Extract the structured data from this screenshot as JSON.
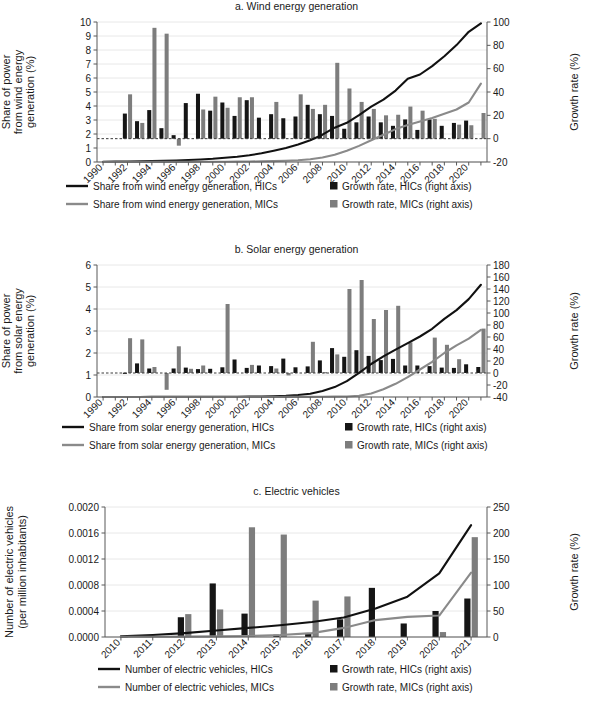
{
  "figure": {
    "cut_off_header": "renewable energy and electric vehicles",
    "panels": [
      "a",
      "b",
      "c"
    ]
  },
  "chart_data": [
    {
      "id": "a",
      "type": "bar",
      "title": "a. Wind energy generation",
      "xlabel": "",
      "ylabel": "Share of power\nfrom wind energy\ngeneration (%)",
      "ylabel_lines": [
        "Share of power",
        "from wind energy",
        "generation (%)"
      ],
      "y2label": "Growth rate (%)",
      "ylim": [
        0,
        10
      ],
      "yticks": [
        0,
        1,
        2,
        3,
        4,
        5,
        6,
        7,
        8,
        9,
        10
      ],
      "y2lim": [
        -20,
        100
      ],
      "y2ticks": [
        -20,
        0,
        20,
        40,
        60,
        80,
        100
      ],
      "grid": true,
      "x": [
        1990,
        1991,
        1992,
        1993,
        1994,
        1995,
        1996,
        1997,
        1998,
        1999,
        2000,
        2001,
        2002,
        2003,
        2004,
        2005,
        2006,
        2007,
        2008,
        2009,
        2010,
        2011,
        2012,
        2013,
        2014,
        2015,
        2016,
        2017,
        2018,
        2019,
        2020,
        2021
      ],
      "xtick_labels": [
        "1990",
        "1992",
        "1994",
        "1996",
        "1998",
        "2000",
        "2002",
        "2004",
        "2006",
        "2008",
        "2010",
        "2012",
        "2014",
        "2016",
        "2018",
        "2020"
      ],
      "series": [
        {
          "name": "Share from wind energy generation, HICs",
          "kind": "line",
          "color": "#111111",
          "axis": "left",
          "values": [
            0.02,
            0.03,
            0.04,
            0.05,
            0.07,
            0.09,
            0.11,
            0.14,
            0.18,
            0.23,
            0.3,
            0.38,
            0.48,
            0.62,
            0.8,
            1.0,
            1.25,
            1.55,
            1.95,
            2.45,
            2.8,
            3.35,
            3.95,
            4.45,
            5.1,
            5.95,
            6.25,
            6.85,
            7.55,
            8.35,
            9.3,
            9.9
          ]
        },
        {
          "name": "Share from wind energy generation, MICs",
          "kind": "line",
          "color": "#8a8a8a",
          "axis": "left",
          "values": [
            0.005,
            0.005,
            0.006,
            0.007,
            0.008,
            0.009,
            0.01,
            0.012,
            0.014,
            0.017,
            0.021,
            0.027,
            0.035,
            0.048,
            0.065,
            0.09,
            0.13,
            0.2,
            0.32,
            0.52,
            0.8,
            1.15,
            1.55,
            1.95,
            2.35,
            2.65,
            2.9,
            3.15,
            3.45,
            3.75,
            4.25,
            5.6
          ]
        },
        {
          "name": "Growth rate, HICs (right axis)",
          "kind": "bar",
          "color": "#151515",
          "axis": "right",
          "values": [
            null,
            null,
            21.5,
            15.0,
            24.5,
            9.0,
            3.0,
            30.5,
            38.5,
            24.0,
            31.0,
            19.5,
            33.0,
            18.0,
            21.0,
            17.5,
            19.0,
            29.0,
            21.0,
            19.5,
            8.5,
            14.0,
            19.0,
            14.0,
            11.0,
            16.5,
            7.5,
            16.5,
            11.0,
            13.5,
            15.5,
            null
          ]
        },
        {
          "name": "Growth rate, MICs (right axis)",
          "kind": "bar",
          "color": "#7d7d7d",
          "axis": "right",
          "values": [
            null,
            null,
            38.0,
            13.5,
            95.0,
            90.0,
            -6.0,
            null,
            25.0,
            36.0,
            26.5,
            35.5,
            35.5,
            null,
            31.5,
            null,
            38.0,
            25.5,
            29.0,
            65.0,
            43.0,
            31.5,
            25.5,
            20.0,
            20.5,
            27.5,
            24.0,
            17.0,
            null,
            12.0,
            11.5,
            22.0
          ]
        }
      ],
      "legend": [
        {
          "marker": "line",
          "color": "#111111",
          "label": "Share from wind energy generation, HICs"
        },
        {
          "marker": "square",
          "color": "#151515",
          "label": "Growth rate, HICs (right axis)"
        },
        {
          "marker": "line",
          "color": "#8a8a8a",
          "label": "Share from wind energy generation, MICs"
        },
        {
          "marker": "square",
          "color": "#7d7d7d",
          "label": "Growth rate, MICs (right axis)"
        }
      ]
    },
    {
      "id": "b",
      "type": "bar",
      "title": "b. Solar energy generation",
      "xlabel": "",
      "ylabel_lines": [
        "Share of power",
        "from solar energy",
        "generation (%)"
      ],
      "y2label": "Growth rate (%)",
      "ylim": [
        0,
        6
      ],
      "yticks": [
        0,
        1,
        2,
        3,
        4,
        5,
        6
      ],
      "y2lim": [
        -40,
        180
      ],
      "y2ticks": [
        -40,
        -20,
        0,
        20,
        40,
        60,
        80,
        100,
        120,
        140,
        160,
        180
      ],
      "grid": true,
      "x": [
        1990,
        1991,
        1992,
        1993,
        1994,
        1995,
        1996,
        1997,
        1998,
        1999,
        2000,
        2001,
        2002,
        2003,
        2004,
        2005,
        2006,
        2007,
        2008,
        2009,
        2010,
        2011,
        2012,
        2013,
        2014,
        2015,
        2016,
        2017,
        2018,
        2019,
        2020,
        2021
      ],
      "xtick_labels": [
        "1990",
        "1992",
        "1994",
        "1996",
        "1998",
        "2000",
        "2002",
        "2004",
        "2006",
        "2008",
        "2010",
        "2012",
        "2014",
        "2016",
        "2018",
        "2020"
      ],
      "series": [
        {
          "name": "Share from solar energy generation, HICs",
          "kind": "line",
          "color": "#111111",
          "axis": "left",
          "values": [
            0.002,
            0.002,
            0.003,
            0.003,
            0.004,
            0.004,
            0.005,
            0.006,
            0.007,
            0.009,
            0.011,
            0.014,
            0.018,
            0.024,
            0.035,
            0.055,
            0.09,
            0.15,
            0.27,
            0.45,
            0.72,
            1.1,
            1.5,
            1.85,
            2.15,
            2.45,
            2.75,
            3.1,
            3.55,
            3.95,
            4.45,
            5.1
          ]
        },
        {
          "name": "Share from solar energy generation, MICs",
          "kind": "line",
          "color": "#8a8a8a",
          "axis": "left",
          "values": [
            0.0,
            0.0,
            0.0,
            0.0,
            0.0,
            0.0,
            0.0,
            0.0,
            0.001,
            0.001,
            0.001,
            0.001,
            0.002,
            0.002,
            0.003,
            0.004,
            0.005,
            0.007,
            0.01,
            0.015,
            0.025,
            0.06,
            0.16,
            0.35,
            0.6,
            0.9,
            1.25,
            1.6,
            2.0,
            2.35,
            2.65,
            3.05
          ]
        },
        {
          "name": "Growth rate, HICs (right axis)",
          "kind": "bar",
          "color": "#151515",
          "axis": "right",
          "values": [
            null,
            null,
            0.5,
            16.0,
            7.5,
            null,
            7.5,
            9.0,
            6.5,
            7.0,
            9.5,
            22.5,
            8.5,
            12.5,
            11.5,
            24.0,
            9.5,
            11.0,
            21.0,
            41.5,
            27.0,
            38.0,
            28.5,
            21.5,
            23.5,
            12.5,
            12.5,
            11.5,
            9.0,
            8.5,
            14.5,
            10.0
          ]
        },
        {
          "name": "Growth rate, MICs (right axis)",
          "kind": "bar",
          "color": "#7d7d7d",
          "axis": "right",
          "values": [
            null,
            null,
            58.0,
            56.0,
            10.0,
            -28.0,
            44.5,
            7.0,
            12.5,
            null,
            115.0,
            null,
            13.5,
            null,
            7.5,
            -4.0,
            null,
            52.0,
            1.5,
            31.0,
            140.0,
            155.0,
            90.0,
            105.0,
            112.0,
            51.0,
            null,
            59.0,
            47.0,
            23.0,
            null,
            74.0
          ]
        }
      ],
      "legend": [
        {
          "marker": "line",
          "color": "#111111",
          "label": "Share from solar energy generation, HICs"
        },
        {
          "marker": "square",
          "color": "#151515",
          "label": "Growth rate, HICs (right axis)"
        },
        {
          "marker": "line",
          "color": "#8a8a8a",
          "label": "Share from solar energy generation, MICs"
        },
        {
          "marker": "square",
          "color": "#7d7d7d",
          "label": "Growth rate, MICs (right axis)"
        }
      ]
    },
    {
      "id": "c",
      "type": "bar",
      "title": "c. Electric vehicles",
      "xlabel": "",
      "ylabel_lines": [
        "Number of electric vehicles",
        "(per million inhabitants)"
      ],
      "y2label": "Growth rate (%)",
      "ylim": [
        0,
        0.002
      ],
      "yticks": [
        0.0,
        0.0004,
        0.0008,
        0.0012,
        0.0016,
        0.002
      ],
      "ytick_labels": [
        "0.0000",
        "0.0004",
        "0.0008",
        "0.0012",
        "0.0016",
        "0.0020"
      ],
      "y2lim": [
        0,
        250
      ],
      "y2ticks": [
        0,
        50,
        100,
        150,
        200,
        250
      ],
      "grid": true,
      "x": [
        2010,
        2011,
        2012,
        2013,
        2014,
        2015,
        2016,
        2017,
        2018,
        2019,
        2020,
        2021
      ],
      "xtick_labels": [
        "2010",
        "2011",
        "2012",
        "2013",
        "2014",
        "2015",
        "2016",
        "2017",
        "2018",
        "2019",
        "2020",
        "2021"
      ],
      "series": [
        {
          "name": "Number of electric vehicles, HICs",
          "kind": "line",
          "color": "#111111",
          "axis": "left",
          "values": [
            1e-05,
            3e-05,
            6e-05,
            0.0001,
            0.00014,
            0.00018,
            0.00023,
            0.0003,
            0.00044,
            0.00062,
            0.00098,
            0.00172
          ]
        },
        {
          "name": "Number of electric vehicles, MICs",
          "kind": "line",
          "color": "#8a8a8a",
          "axis": "left",
          "values": [
            3e-06,
            4e-06,
            6e-06,
            1e-05,
            1.6e-05,
            3e-05,
            6e-05,
            0.00014,
            0.00026,
            0.00031,
            0.00033,
            0.00099
          ]
        },
        {
          "name": "Growth rate, HICs (right axis)",
          "kind": "bar",
          "color": "#151515",
          "axis": "right",
          "values": [
            null,
            null,
            38.0,
            103.0,
            45.0,
            4.5,
            7.5,
            34.0,
            94.5,
            26.0,
            50.0,
            74.0
          ]
        },
        {
          "name": "Growth rate, MICs (right axis)",
          "kind": "bar",
          "color": "#7d7d7d",
          "axis": "right",
          "values": [
            1.0,
            null,
            44.0,
            53.0,
            211.0,
            197.0,
            70.0,
            78.0,
            null,
            null,
            9.5,
            192.0
          ]
        }
      ],
      "legend": [
        {
          "marker": "line",
          "color": "#111111",
          "label": "Number of electric vehicles, HICs"
        },
        {
          "marker": "square",
          "color": "#151515",
          "label": "Growth rate, HICs (right axis)"
        },
        {
          "marker": "line",
          "color": "#8a8a8a",
          "label": "Number of electric vehicles, MICs"
        },
        {
          "marker": "square",
          "color": "#7d7d7d",
          "label": "Growth rate, MICs (right axis)"
        }
      ]
    }
  ]
}
